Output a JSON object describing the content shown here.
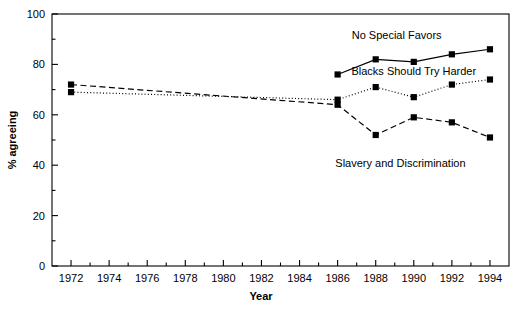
{
  "chart_data": {
    "type": "line",
    "title": "",
    "xlabel": "Year",
    "ylabel": "% agreeing",
    "xlim": [
      1971,
      1995
    ],
    "ylim": [
      0,
      100
    ],
    "grid": false,
    "legend_position": "inline-annotations",
    "x_ticks": [
      1972,
      1974,
      1976,
      1978,
      1980,
      1982,
      1984,
      1986,
      1988,
      1990,
      1992,
      1994
    ],
    "x_tick_labels": [
      "1972",
      "1974",
      "1976",
      "1978",
      "1980",
      "1982",
      "1984",
      "1986",
      "1988",
      "1990",
      "1992",
      "1994"
    ],
    "y_ticks": [
      0,
      20,
      40,
      60,
      80,
      100
    ],
    "y_tick_labels": [
      "0",
      "20",
      "40",
      "60",
      "80",
      "100"
    ],
    "y_minor_ticks": [
      10,
      30,
      50,
      70,
      90
    ],
    "marker": "square",
    "series": [
      {
        "name": "No Special Favors",
        "line_style": "solid",
        "color": "#000000",
        "x": [
          1986,
          1988,
          1990,
          1992,
          1994
        ],
        "values": [
          76,
          82,
          81,
          84,
          86
        ],
        "annotation": "No Special Favors",
        "annotation_x": 1989.1,
        "annotation_y": 91.5
      },
      {
        "name": "Blacks Should Try Harder",
        "line_style": "dotted",
        "color": "#000000",
        "x": [
          1972,
          1986,
          1988,
          1990,
          1992,
          1994
        ],
        "values": [
          69,
          66,
          71,
          67,
          72,
          74
        ],
        "annotation": "Blacks Should Try Harder",
        "annotation_x": 1990.0,
        "annotation_y": 77.5
      },
      {
        "name": "Slavery and Discrimination",
        "line_style": "dashed",
        "color": "#000000",
        "x": [
          1972,
          1986,
          1988,
          1990,
          1992,
          1994
        ],
        "values": [
          72,
          64,
          52,
          59,
          57,
          51
        ],
        "annotation": "Slavery and Discrimination",
        "annotation_x": 1989.3,
        "annotation_y": 41.0
      }
    ]
  }
}
